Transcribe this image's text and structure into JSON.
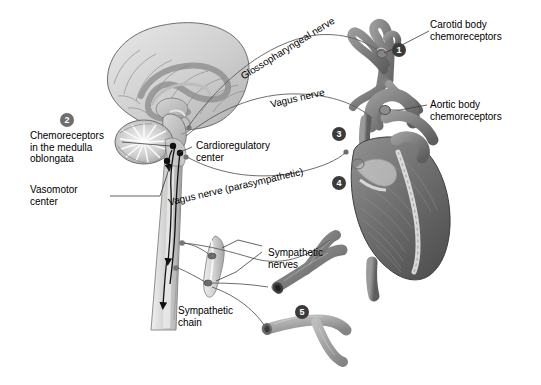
{
  "figure": {
    "background_color": "#ffffff",
    "text_color": "#000000",
    "leader_line_color": "#55555a",
    "badge_dark_color": "#3b3b3b",
    "badge_mid_color": "#6e6e6e"
  },
  "labels": {
    "carotid_body": "Carotid body\nchemoreceptors",
    "aortic_body": "Aortic body\nchemoreceptors",
    "glossopharyngeal_nerve": "Glossopharyngeal nerve",
    "vagus_nerve": "Vagus nerve",
    "vagus_nerve_parasympathetic": "Vagus nerve (parasympathetic)",
    "chemoreceptors_medulla": "Chemoreceptors\nin the medulla\noblongata",
    "vasomotor_center": "Vasomotor\ncenter",
    "cardioregulatory_center": "Cardioregulatory\ncenter",
    "sympathetic_nerves": "Sympathetic\nnerves",
    "sympathetic_chain": "Sympathetic\nchain"
  },
  "badges": [
    {
      "id": "badge-1",
      "number": "1",
      "style": "dark",
      "x": 392,
      "y": 43,
      "target": "carotid-body-chemoreceptors"
    },
    {
      "id": "badge-2",
      "number": "2",
      "style": "mid",
      "x": 60,
      "y": 113,
      "target": "chemoreceptors-medulla-oblongata"
    },
    {
      "id": "badge-3",
      "number": "3",
      "style": "dark",
      "x": 332,
      "y": 127,
      "target": "cardioregulatory-center-heart"
    },
    {
      "id": "badge-4",
      "number": "4",
      "style": "dark",
      "x": 332,
      "y": 176,
      "target": "sympathetic-innervation-heart"
    },
    {
      "id": "badge-5",
      "number": "5",
      "style": "dark",
      "x": 295,
      "y": 305,
      "target": "blood-vessels"
    }
  ],
  "anatomy": [
    {
      "name": "brain-sagittal-section",
      "description": "Midsagittal section of cerebrum with cerebellum, brainstem and spinal cord"
    },
    {
      "name": "cerebellum",
      "description": "Cerebellum with arbor vitae"
    },
    {
      "name": "medulla-oblongata",
      "description": "Medulla oblongata containing chemoreceptors and control centers"
    },
    {
      "name": "spinal-cord",
      "description": "Spinal cord descending with ascending and descending tracts"
    },
    {
      "name": "heart",
      "description": "Heart with aorta, pulmonary trunk and coronary vessels"
    },
    {
      "name": "carotid-arteries",
      "description": "Common carotid artery bifurcation with carotid body"
    },
    {
      "name": "aorta",
      "description": "Aortic arch bearing aortic bodies"
    },
    {
      "name": "sympathetic-chain-ganglia",
      "description": "Paravertebral sympathetic chain with two ganglia"
    },
    {
      "name": "blood-vessel-upper",
      "description": "Branching blood vessel, dark"
    },
    {
      "name": "blood-vessel-lower",
      "description": "Branching blood vessel, light"
    }
  ]
}
